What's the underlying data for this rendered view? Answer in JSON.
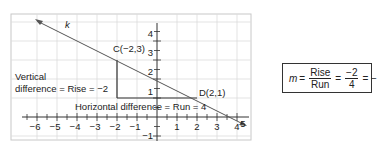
{
  "diagram": {
    "line_label": "k",
    "point_c": {
      "label": "C(−2,3)",
      "x": -2,
      "y": 3
    },
    "point_d": {
      "label": "D(2,1)",
      "x": 2,
      "y": 1
    },
    "vertical_label_line1": "Vertical",
    "vertical_label_line2": "difference = Rise = −2",
    "horizontal_label": "Horizontal difference = Run = 4",
    "x_ticks": [
      "−6",
      "−5",
      "−4",
      "−3",
      "−2",
      "−1",
      "1",
      "2",
      "3",
      "4",
      "5"
    ],
    "y_ticks": [
      "4",
      "3",
      "2",
      "1",
      "−1"
    ],
    "x_range": [
      -6.5,
      5.5
    ],
    "y_range": [
      -1.5,
      4.7
    ]
  },
  "formula": {
    "var": "m",
    "eq1": "=",
    "num1": "Rise",
    "den1": "Run",
    "eq2": "=",
    "num2": "−2",
    "den2": "4",
    "tail": "= −"
  },
  "colors": {
    "grid": "#d9d9d9",
    "axis": "#333333",
    "line": "#555555",
    "frame": "#bbbbbb"
  }
}
